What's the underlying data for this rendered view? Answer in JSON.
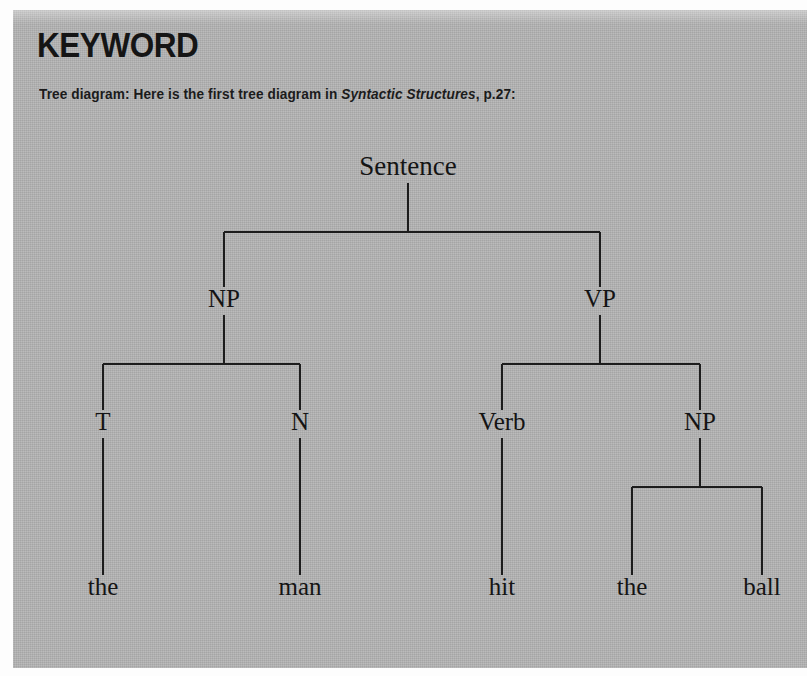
{
  "panel": {
    "heading": "KEYWORD",
    "caption_prefix": "Tree diagram: Here is the first tree diagram in ",
    "caption_source": "Syntactic Structures",
    "caption_suffix": ", p.27:",
    "background_color": "#b3b3b3",
    "text_color": "#151515"
  },
  "chart_data": {
    "type": "diagram",
    "subtype": "syntactic-tree",
    "sentence": "the man hit the ball",
    "nodes": [
      {
        "id": "sentence",
        "label": "Sentence",
        "level": 0,
        "x": 408,
        "y": 175
      },
      {
        "id": "np1",
        "label": "NP",
        "level": 1,
        "x": 224,
        "y": 307
      },
      {
        "id": "vp",
        "label": "VP",
        "level": 1,
        "x": 600,
        "y": 307
      },
      {
        "id": "t1",
        "label": "T",
        "level": 2,
        "x": 103,
        "y": 430
      },
      {
        "id": "n1",
        "label": "N",
        "level": 2,
        "x": 300,
        "y": 430
      },
      {
        "id": "verb",
        "label": "Verb",
        "level": 2,
        "x": 502,
        "y": 430
      },
      {
        "id": "np2",
        "label": "NP",
        "level": 2,
        "x": 700,
        "y": 430
      },
      {
        "id": "the1",
        "label": "the",
        "level": 3,
        "x": 103,
        "y": 595
      },
      {
        "id": "man",
        "label": "man",
        "level": 3,
        "x": 300,
        "y": 595
      },
      {
        "id": "hit",
        "label": "hit",
        "level": 3,
        "x": 502,
        "y": 595
      },
      {
        "id": "the2",
        "label": "the",
        "level": 3,
        "x": 632,
        "y": 595
      },
      {
        "id": "ball",
        "label": "ball",
        "level": 3,
        "x": 762,
        "y": 595
      }
    ],
    "edges": [
      {
        "from": "sentence",
        "to": "np1"
      },
      {
        "from": "sentence",
        "to": "vp"
      },
      {
        "from": "np1",
        "to": "t1"
      },
      {
        "from": "np1",
        "to": "n1"
      },
      {
        "from": "vp",
        "to": "verb"
      },
      {
        "from": "vp",
        "to": "np2"
      },
      {
        "from": "t1",
        "to": "the1"
      },
      {
        "from": "n1",
        "to": "man"
      },
      {
        "from": "verb",
        "to": "hit"
      },
      {
        "from": "np2",
        "to": "the2"
      },
      {
        "from": "np2",
        "to": "ball"
      }
    ],
    "line_color": "#1d1d1d"
  }
}
